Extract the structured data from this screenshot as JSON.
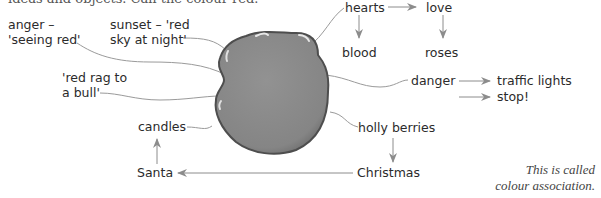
{
  "header": {
    "cropped_line": "ideas and objects. Call the colour red."
  },
  "diagram": {
    "central_shape": {
      "name": "red-colour-blob",
      "fill": "#8a8a8a",
      "stroke": "#4a4a4a"
    },
    "nodes": {
      "anger": [
        "anger –",
        "'seeing red'"
      ],
      "sunset": [
        "sunset – 'red",
        "sky at night'"
      ],
      "red_rag": [
        "'red rag to",
        "a bull'"
      ],
      "candles": "candles",
      "santa": "Santa",
      "christmas": "Christmas",
      "holly": "holly berries",
      "danger": "danger",
      "traffic_lights": "traffic lights",
      "stop": "stop!",
      "hearts": "hearts",
      "love": "love",
      "blood": "blood",
      "roses": "roses"
    },
    "edges": [
      {
        "from": "blob",
        "to": "anger",
        "type": "line"
      },
      {
        "from": "blob",
        "to": "sunset",
        "type": "line"
      },
      {
        "from": "blob",
        "to": "red_rag",
        "type": "line"
      },
      {
        "from": "blob",
        "to": "candles",
        "type": "line"
      },
      {
        "from": "blob",
        "to": "hearts",
        "type": "line"
      },
      {
        "from": "blob",
        "to": "danger",
        "type": "line"
      },
      {
        "from": "blob",
        "to": "holly",
        "type": "line"
      },
      {
        "from": "hearts",
        "to": "love",
        "type": "arrow"
      },
      {
        "from": "hearts",
        "to": "blood",
        "type": "arrow"
      },
      {
        "from": "love",
        "to": "roses",
        "type": "arrow"
      },
      {
        "from": "danger",
        "to": "traffic_lights",
        "type": "arrow"
      },
      {
        "from": "danger",
        "to": "stop",
        "type": "arrow"
      },
      {
        "from": "holly",
        "to": "christmas",
        "type": "arrow"
      },
      {
        "from": "christmas",
        "to": "santa",
        "type": "arrow"
      },
      {
        "from": "santa",
        "to": "candles",
        "type": "arrow"
      }
    ],
    "line_color": "#9a9a9a",
    "arrow_color": "#8c8c8c"
  },
  "caption": [
    "This is called",
    "colour association."
  ]
}
